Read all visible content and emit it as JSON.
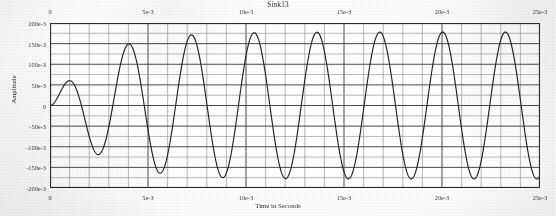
{
  "figure": {
    "title": "Sink13",
    "colors": {
      "trace": "#222222",
      "grid_major": "#4a4a4a",
      "grid_minor": "#9a9a9a",
      "frame": "#2b2b2b",
      "text": "#2e2e2e",
      "paper": "#fbfbfa"
    }
  },
  "chart_data": {
    "type": "line",
    "title": "Sink13",
    "xlabel": "Time in Seconds",
    "ylabel": "Amplitude",
    "xlim": [
      0,
      0.025
    ],
    "ylim": [
      -0.2,
      0.2
    ],
    "grid": true,
    "legend": "none",
    "x_ticks": [
      0,
      0.005,
      0.01,
      0.015,
      0.02,
      0.025
    ],
    "x_tick_labels": [
      "0",
      "5e-3",
      "10e-3",
      "15e-3",
      "20e-3",
      "25e-3"
    ],
    "x_tick_labels_top": [
      "0",
      "5e-3",
      "10e-3",
      "15e-3",
      "20e-3",
      "25e-3"
    ],
    "x_minor_step": 0.001,
    "y_ticks": [
      0.2,
      0.15,
      0.1,
      0.05,
      0,
      -0.05,
      -0.1,
      -0.15,
      -0.2
    ],
    "y_tick_labels": [
      "200e-3",
      "150e-3",
      "100e-3",
      "50e-3",
      "0",
      "-50e-3",
      "-100e-3",
      "-150e-3",
      "-200e-3"
    ],
    "y_minor_step": 0.025,
    "axis_top_ticks": true,
    "axis_bottom_ticks": true,
    "series": [
      {
        "name": "Sink13",
        "waveform": "ramped-onset sine",
        "frequency_hz": 312,
        "period_s": 0.0032,
        "phase_rad": 0,
        "steady_amplitude": 0.178,
        "onset_amplitude": 0.0,
        "envelope": "1 - exp(-t/0.0022) with slight overshoot ripple",
        "first_peak": {
          "x": 0.0011,
          "y": 0.151
        },
        "first_trough": {
          "x": 0.00275,
          "y": -0.168
        },
        "second_peak": {
          "x": 0.0043,
          "y": 0.173
        },
        "steady_peaks_y": 0.176,
        "steady_troughs_y": -0.178,
        "points": [
          [
            0.0,
            0.0
          ],
          [
            0.0002,
            0.006
          ],
          [
            0.0004,
            0.022
          ],
          [
            0.0006,
            0.052
          ],
          [
            0.0008,
            0.092
          ],
          [
            0.001,
            0.131
          ],
          [
            0.0011,
            0.151
          ],
          [
            0.0013,
            0.148
          ],
          [
            0.0015,
            0.118
          ],
          [
            0.0017,
            0.07
          ],
          [
            0.0019,
            0.012
          ],
          [
            0.0021,
            -0.052
          ],
          [
            0.0023,
            -0.11
          ],
          [
            0.0025,
            -0.152
          ],
          [
            0.0027,
            -0.168
          ],
          [
            0.0029,
            -0.16
          ],
          [
            0.0031,
            -0.126
          ],
          [
            0.0033,
            -0.07
          ],
          [
            0.0035,
            -0.002
          ],
          [
            0.0037,
            0.068
          ],
          [
            0.0039,
            0.126
          ],
          [
            0.0041,
            0.162
          ],
          [
            0.0043,
            0.173
          ],
          [
            0.0045,
            0.158
          ],
          [
            0.0047,
            0.118
          ],
          [
            0.0049,
            0.058
          ],
          [
            0.0051,
            -0.012
          ],
          [
            0.0053,
            -0.08
          ],
          [
            0.0055,
            -0.135
          ],
          [
            0.0057,
            -0.169
          ],
          [
            0.0059,
            -0.176
          ],
          [
            0.0061,
            -0.156
          ],
          [
            0.0063,
            -0.112
          ],
          [
            0.0065,
            -0.05
          ],
          [
            0.0067,
            0.02
          ],
          [
            0.0069,
            0.088
          ],
          [
            0.0071,
            0.14
          ],
          [
            0.0073,
            0.171
          ],
          [
            0.0075,
            0.175
          ],
          [
            0.0077,
            0.152
          ],
          [
            0.0079,
            0.104
          ],
          [
            0.0081,
            0.04
          ],
          [
            0.0083,
            -0.03
          ],
          [
            0.0085,
            -0.096
          ],
          [
            0.0087,
            -0.146
          ],
          [
            0.0089,
            -0.174
          ],
          [
            0.0091,
            -0.176
          ],
          [
            0.0093,
            -0.15
          ],
          [
            0.0095,
            -0.098
          ],
          [
            0.0097,
            -0.032
          ],
          [
            0.0099,
            0.04
          ],
          [
            0.0101,
            0.106
          ],
          [
            0.0103,
            0.152
          ],
          [
            0.0105,
            0.176
          ],
          [
            0.0107,
            0.173
          ],
          [
            0.0109,
            0.142
          ],
          [
            0.0111,
            0.088
          ],
          [
            0.0113,
            0.02
          ],
          [
            0.0115,
            -0.05
          ],
          [
            0.0117,
            -0.116
          ],
          [
            0.0119,
            -0.158
          ],
          [
            0.0121,
            -0.178
          ],
          [
            0.0123,
            -0.17
          ],
          [
            0.0125,
            -0.136
          ],
          [
            0.0127,
            -0.082
          ],
          [
            0.0129,
            -0.012
          ],
          [
            0.0131,
            0.058
          ],
          [
            0.0133,
            0.122
          ],
          [
            0.0135,
            0.162
          ],
          [
            0.0137,
            0.177
          ],
          [
            0.0139,
            0.164
          ],
          [
            0.0141,
            0.126
          ],
          [
            0.0143,
            0.068
          ],
          [
            0.0145,
            -0.002
          ],
          [
            0.0147,
            -0.07
          ],
          [
            0.0149,
            -0.13
          ],
          [
            0.0151,
            -0.167
          ],
          [
            0.0153,
            -0.178
          ],
          [
            0.0155,
            -0.162
          ],
          [
            0.0157,
            -0.118
          ],
          [
            0.0159,
            -0.056
          ],
          [
            0.0161,
            0.014
          ],
          [
            0.0163,
            0.082
          ],
          [
            0.0165,
            0.138
          ],
          [
            0.0167,
            0.172
          ],
          [
            0.0169,
            0.176
          ],
          [
            0.0171,
            0.15
          ],
          [
            0.0173,
            0.1
          ],
          [
            0.0175,
            0.034
          ],
          [
            0.0177,
            -0.036
          ],
          [
            0.0179,
            -0.1
          ],
          [
            0.0181,
            -0.15
          ],
          [
            0.0183,
            -0.176
          ],
          [
            0.0185,
            -0.176
          ],
          [
            0.0187,
            -0.146
          ],
          [
            0.0189,
            -0.094
          ],
          [
            0.0191,
            -0.026
          ],
          [
            0.0193,
            0.044
          ],
          [
            0.0195,
            0.108
          ],
          [
            0.0197,
            0.155
          ],
          [
            0.0199,
            0.176
          ],
          [
            0.0201,
            0.171
          ],
          [
            0.0203,
            0.138
          ],
          [
            0.0205,
            0.082
          ],
          [
            0.0207,
            0.014
          ],
          [
            0.0209,
            -0.056
          ],
          [
            0.0211,
            -0.12
          ],
          [
            0.0213,
            -0.162
          ],
          [
            0.0215,
            -0.178
          ],
          [
            0.0217,
            -0.168
          ],
          [
            0.0219,
            -0.132
          ],
          [
            0.0221,
            -0.076
          ],
          [
            0.0223,
            -0.006
          ],
          [
            0.0225,
            0.064
          ],
          [
            0.0227,
            0.126
          ],
          [
            0.0229,
            0.166
          ],
          [
            0.0231,
            0.177
          ],
          [
            0.0233,
            0.16
          ],
          [
            0.0235,
            0.12
          ],
          [
            0.0237,
            0.06
          ],
          [
            0.0239,
            -0.01
          ],
          [
            0.0241,
            -0.078
          ],
          [
            0.0243,
            -0.136
          ],
          [
            0.0245,
            -0.17
          ],
          [
            0.0247,
            -0.178
          ],
          [
            0.0249,
            -0.158
          ],
          [
            0.025,
            -0.146
          ]
        ]
      }
    ]
  }
}
